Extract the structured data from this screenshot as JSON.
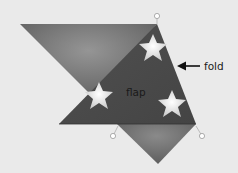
{
  "diagram": {
    "labels": {
      "fold": "fold",
      "flap": "flap"
    },
    "colors": {
      "background": "#eaeaea",
      "back_triangle": "#6e6e6e",
      "back_highlight": "#8c8c8c",
      "flap": "#4a4a4a",
      "star": "#f2f2f2",
      "pin": "#ffffff",
      "arrow": "#111111"
    },
    "stars": [
      {
        "name": "star-top",
        "x": 153,
        "y": 48
      },
      {
        "name": "star-left",
        "x": 99,
        "y": 96
      },
      {
        "name": "star-right",
        "x": 172,
        "y": 104
      }
    ],
    "pins": [
      {
        "name": "pin-top",
        "x": 157,
        "y": 16
      },
      {
        "name": "pin-bottom-left",
        "x": 113,
        "y": 136
      },
      {
        "name": "pin-bottom-right",
        "x": 202,
        "y": 136
      }
    ]
  }
}
